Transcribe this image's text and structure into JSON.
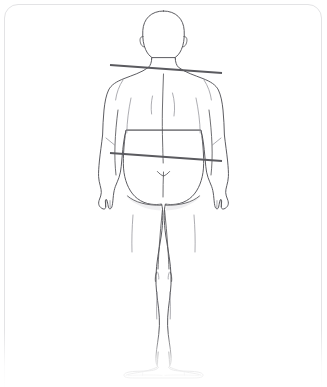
{
  "panel": {
    "background_color": "#ffffff",
    "border_color": "#e3e3e5",
    "corner_radius_px": 14
  },
  "diagram": {
    "view": "back",
    "outline_color": "#4a4a4f",
    "detail_color": "#555559",
    "fill_color": "#ffffff",
    "shade_color": "#e9e9ec"
  },
  "measurements": {
    "line_color": "#5a5a5f",
    "line_width_px": 2.1,
    "lines": [
      {
        "name": "shoulder-measurement-line",
        "label": "Shoulder width",
        "x1": 110,
        "y1": 65,
        "x2": 222,
        "y2": 73
      },
      {
        "name": "waist-measurement-line",
        "label": "Waist / hip width",
        "x1": 110,
        "y1": 153,
        "x2": 222,
        "y2": 161
      }
    ]
  },
  "body_parts": [
    "head",
    "left-ear",
    "right-ear",
    "neck",
    "left-shoulder",
    "right-shoulder",
    "spine",
    "left-scapula",
    "right-scapula",
    "left-arm",
    "right-arm",
    "left-hand",
    "right-hand",
    "buttocks",
    "left-thigh",
    "right-thigh",
    "left-knee",
    "right-knee",
    "left-calf",
    "right-calf",
    "left-foot",
    "right-foot"
  ]
}
